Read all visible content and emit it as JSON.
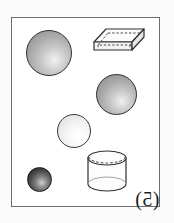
{
  "figure": {
    "label_open_paren": "(",
    "label_number": "5",
    "label_close_paren": ")",
    "label_full": "(5)",
    "label_orientation": "number mirrored horizontally",
    "background_color": "#ffffff",
    "frame_color": "#6e6e6e",
    "outline_color": "#2e2e2e"
  },
  "objects": [
    {
      "name": "large-light-gray-sphere",
      "type": "sphere",
      "shade": "medium light gray",
      "fill_color": "#b0b0b0",
      "highlight_color": "#f2f2f2",
      "diameter_px": 46,
      "x_px": 26,
      "y_px": 30
    },
    {
      "name": "open-rectangular-box",
      "type": "rectangular prism",
      "shade": "white with gray edges",
      "fill_color": "#fdfdfd",
      "hidden_edges": "dashed",
      "width_px": 52,
      "height_px": 33,
      "x_px": 92,
      "y_px": 27
    },
    {
      "name": "medium-gray-sphere",
      "type": "sphere",
      "shade": "medium gray",
      "fill_color": "#ababab",
      "highlight_color": "#f0f0f0",
      "diameter_px": 41,
      "x_px": 96,
      "y_px": 74
    },
    {
      "name": "small-white-sphere",
      "type": "sphere",
      "shade": "very light / white",
      "fill_color": "#f2f2f2",
      "highlight_color": "#ffffff",
      "diameter_px": 34,
      "x_px": 57,
      "y_px": 114
    },
    {
      "name": "small-dark-sphere",
      "type": "sphere",
      "shade": "dark gray / near black",
      "fill_color": "#2c2c2c",
      "highlight_color": "#cfcfcf",
      "diameter_px": 25,
      "x_px": 27,
      "y_px": 167
    },
    {
      "name": "cylinder",
      "type": "cylinder",
      "shade": "white with gray outline",
      "fill_color": "#fdfdfd",
      "hidden_edges": "dashed",
      "width_px": 42,
      "height_px": 45,
      "x_px": 85,
      "y_px": 149
    }
  ]
}
